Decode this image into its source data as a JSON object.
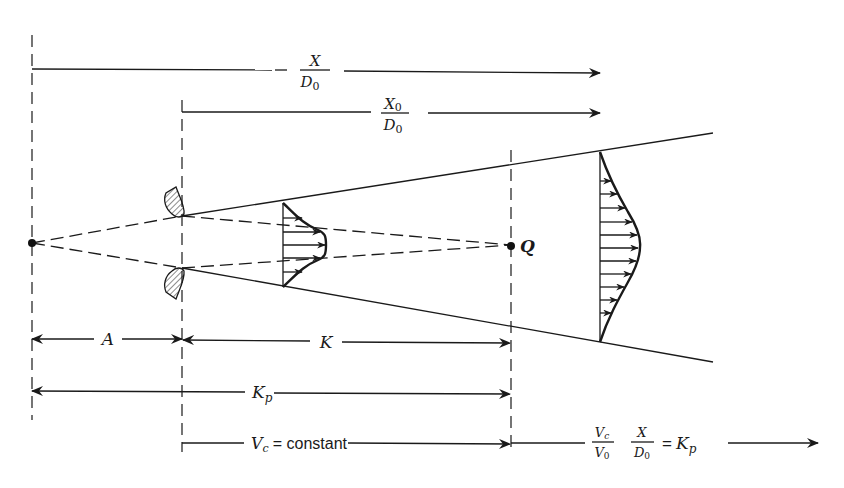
{
  "figure": {
    "labels": {
      "x_over_d0": {
        "num": "X",
        "den": "D",
        "den_sub": "0"
      },
      "x0_over_d0": {
        "num": "X",
        "num_sub": "0",
        "den": "D",
        "den_sub": "0"
      },
      "point_q": "Q",
      "dim_a": "A",
      "dim_k": "K",
      "dim_kp": {
        "main": "K",
        "sub": "p"
      },
      "core_region": {
        "lhs": "V",
        "lhs_sub": "c",
        "rhs": "= constant"
      },
      "decay_region": {
        "frac1_num": "V",
        "frac1_num_sub": "c",
        "frac1_den": "V",
        "frac1_den_sub": "0",
        "frac2_num": "X",
        "frac2_den": "D",
        "frac2_den_sub": "0",
        "rhs_eq": "=",
        "rhs": "K",
        "rhs_sub": "p"
      }
    },
    "elements": {
      "virtual_origin": "point",
      "nozzle": "hatched nozzle lip (upper and lower)",
      "core_profile": "flat-topped velocity profile with arrows",
      "developed_profile": "bell-shaped velocity profile with arrows",
      "jet_boundary": "solid spreading lines",
      "core_boundary": "dashed converging lines to Q"
    },
    "colors": {
      "ink": "#1a1a1a",
      "background": "#ffffff"
    }
  }
}
